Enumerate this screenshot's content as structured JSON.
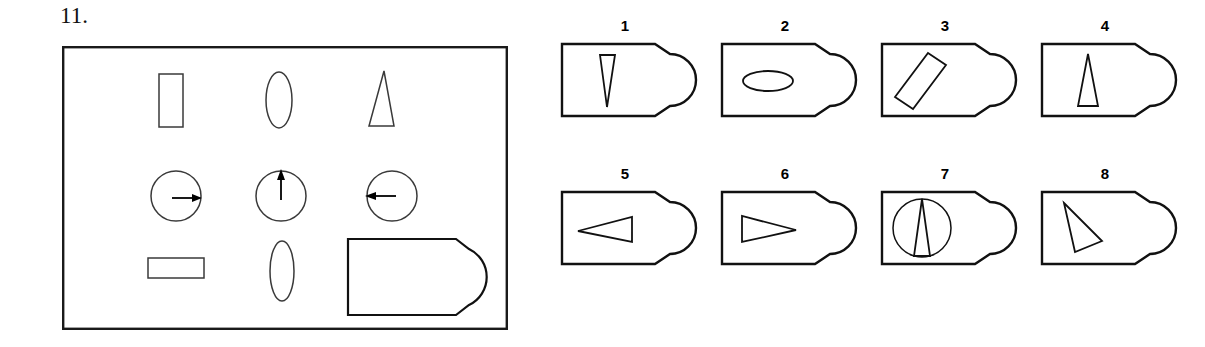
{
  "page": {
    "question_number": "11.",
    "background_color": "#ffffff",
    "ink_color": "#000000"
  },
  "stimulus": {
    "name": "stimulus-panel",
    "border_color": "#000000",
    "shapes": [
      {
        "id": "s1",
        "name": "vertical-rectangle",
        "row": 1,
        "col": 1,
        "kind": "rect"
      },
      {
        "id": "s2",
        "name": "vertical-ellipse",
        "row": 1,
        "col": 2,
        "kind": "ellipse"
      },
      {
        "id": "s3",
        "name": "narrow-triangle-up",
        "row": 1,
        "col": 3,
        "kind": "triangle"
      },
      {
        "id": "s4",
        "name": "circle-with-arrow-right",
        "row": 2,
        "col": 1,
        "kind": "circle-arrow",
        "arrow_direction": "right"
      },
      {
        "id": "s5",
        "name": "circle-with-arrow-up",
        "row": 2,
        "col": 2,
        "kind": "circle-arrow",
        "arrow_direction": "up"
      },
      {
        "id": "s6",
        "name": "circle-with-arrow-left",
        "row": 2,
        "col": 3,
        "kind": "circle-arrow",
        "arrow_direction": "left"
      },
      {
        "id": "s7",
        "name": "horizontal-rectangle",
        "row": 3,
        "col": 1,
        "kind": "rect"
      },
      {
        "id": "s8",
        "name": "vertical-ellipse-small",
        "row": 3,
        "col": 2,
        "kind": "ellipse"
      },
      {
        "id": "s9",
        "name": "d-shape-plug-large",
        "row": 3,
        "col": 3,
        "kind": "d-shape"
      }
    ]
  },
  "options": [
    {
      "label": "1",
      "name": "option-1",
      "figure": "narrow-triangle-apex-down",
      "figure_description": "narrow triangle pointing down, centered"
    },
    {
      "label": "2",
      "name": "option-2",
      "figure": "horizontal-ellipse",
      "figure_description": "small horizontal ellipse, centered left of middle"
    },
    {
      "label": "3",
      "name": "option-3",
      "figure": "tilted-rectangle",
      "figure_description": "elongated rectangle tilted about 40 degrees"
    },
    {
      "label": "4",
      "name": "option-4",
      "figure": "narrow-triangle-apex-up",
      "figure_description": "narrow triangle pointing up, centered"
    },
    {
      "label": "5",
      "name": "option-5",
      "figure": "horizontal-triangle-pointing-left",
      "figure_description": "flat triangle pointing left"
    },
    {
      "label": "6",
      "name": "option-6",
      "figure": "horizontal-triangle-pointing-right",
      "figure_description": "flat triangle pointing right"
    },
    {
      "label": "7",
      "name": "option-7",
      "figure": "circle-with-inscribed-triangle",
      "figure_description": "circle containing a narrow upward triangle"
    },
    {
      "label": "8",
      "name": "option-8",
      "figure": "tilted-narrow-triangle",
      "figure_description": "narrow triangle apex top-left leaning down-right"
    }
  ]
}
